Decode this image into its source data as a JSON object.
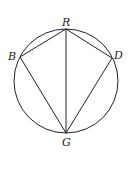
{
  "diagram": {
    "type": "inscribed-quadrilateral",
    "circle": {
      "cx": 66,
      "cy": 81,
      "r": 52
    },
    "points": {
      "R": {
        "label": "R",
        "x": 66,
        "y": 29
      },
      "B": {
        "label": "B",
        "x": 20,
        "y": 57
      },
      "D": {
        "label": "D",
        "x": 112,
        "y": 58
      },
      "G": {
        "label": "G",
        "x": 66,
        "y": 133
      }
    },
    "segments": [
      "RB",
      "RD",
      "RG",
      "BG",
      "DG"
    ],
    "stroke_color": "#222222",
    "background": "#ffffff"
  }
}
